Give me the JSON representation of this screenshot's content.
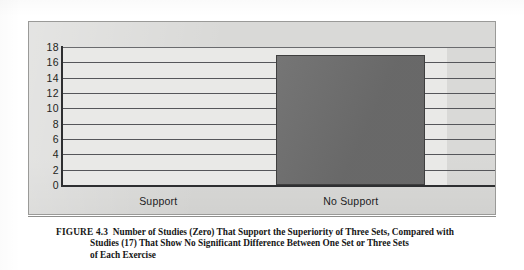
{
  "chart_data": {
    "type": "bar",
    "title": "",
    "subtitle": "",
    "xlabel": "",
    "ylabel": "",
    "categories": [
      "Support",
      "No Support"
    ],
    "values": [
      0,
      17
    ],
    "ylim": [
      0,
      18
    ],
    "yticks": [
      0,
      2,
      4,
      6,
      8,
      10,
      12,
      14,
      16,
      18
    ],
    "ytick_labels": [
      "0",
      "2",
      "4",
      "6",
      "8",
      "10",
      "12",
      "14",
      "16",
      "18"
    ],
    "grid": true,
    "grid_axis": "y",
    "legend": false,
    "legend_position": "none",
    "bar_color": "#6e6e6e",
    "panel_color": "#d9d9d7",
    "plot_color": "#e9e9e7",
    "axis_color": "#2e2f31",
    "annotations": []
  },
  "caption": {
    "figure_number": "FIGURE 4.3",
    "line1": "Number of Studies (Zero) That Support the Superiority of Three Sets, Compared with",
    "line2": "Studies (17) That Show No Significant Difference Between One Set or Three Sets",
    "line3": "of Each Exercise"
  }
}
